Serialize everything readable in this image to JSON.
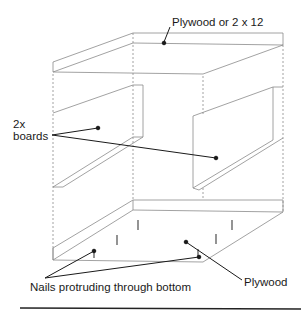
{
  "diagram": {
    "type": "isometric box construction",
    "labels": {
      "top": "Plywood or 2 x 12",
      "boards_line1": "2x",
      "boards_line2": "boards",
      "nails": "Nails protruding through bottom",
      "bottom": "Plywood"
    },
    "colors": {
      "line": "#8a8a8a",
      "leader": "#1a1a1a",
      "rule": "#222222"
    }
  }
}
